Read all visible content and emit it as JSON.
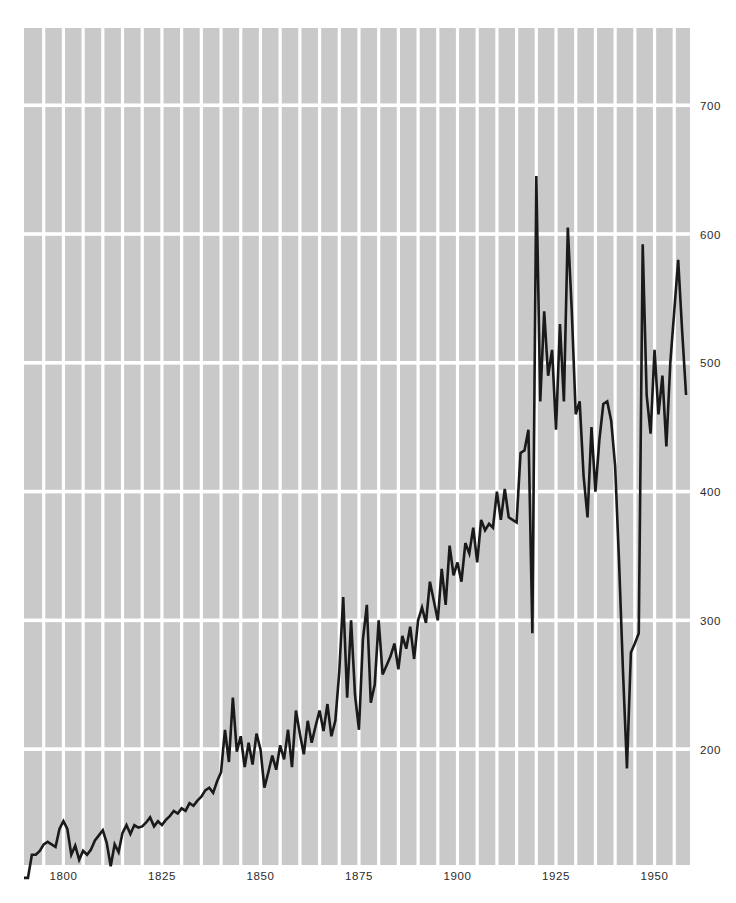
{
  "chart_data": {
    "type": "line",
    "title": "",
    "subtitle": "",
    "xlabel": "",
    "ylabel": "",
    "xlim": [
      1790,
      1959
    ],
    "ylim": [
      110,
      760
    ],
    "grid": true,
    "grid_x_step": 5,
    "legend": "none",
    "axis": {
      "y_ticks": [
        200,
        300,
        400,
        500,
        600,
        700
      ],
      "y_tick_labels": [
        "200",
        "300",
        "400",
        "500",
        "600",
        "700"
      ],
      "x_ticks": [
        1800,
        1825,
        1850,
        1875,
        1900,
        1925,
        1950
      ],
      "x_tick_labels": [
        "1800",
        "1825",
        "1850",
        "1875",
        "1900",
        "1925",
        "1950"
      ]
    },
    "colors": {
      "plot_background": "#c9c9c9",
      "gridline": "#ffffff",
      "line": "#1a1a1a",
      "page_background": "#ffffff",
      "tick_text": "#2b2b2b"
    },
    "series": [
      {
        "name": "value",
        "x": [
          1790,
          1791,
          1792,
          1793,
          1794,
          1795,
          1796,
          1797,
          1798,
          1799,
          1800,
          1801,
          1802,
          1803,
          1804,
          1805,
          1806,
          1807,
          1808,
          1809,
          1810,
          1811,
          1812,
          1813,
          1814,
          1815,
          1816,
          1817,
          1818,
          1819,
          1820,
          1821,
          1822,
          1823,
          1824,
          1825,
          1826,
          1827,
          1828,
          1829,
          1830,
          1831,
          1832,
          1833,
          1834,
          1835,
          1836,
          1837,
          1838,
          1839,
          1840,
          1841,
          1842,
          1843,
          1844,
          1845,
          1846,
          1847,
          1848,
          1849,
          1850,
          1851,
          1852,
          1853,
          1854,
          1855,
          1856,
          1857,
          1858,
          1859,
          1860,
          1861,
          1862,
          1863,
          1864,
          1865,
          1866,
          1867,
          1868,
          1869,
          1870,
          1871,
          1872,
          1873,
          1874,
          1875,
          1876,
          1877,
          1878,
          1879,
          1880,
          1881,
          1882,
          1883,
          1884,
          1885,
          1886,
          1887,
          1888,
          1889,
          1890,
          1891,
          1892,
          1893,
          1894,
          1895,
          1896,
          1897,
          1898,
          1899,
          1900,
          1901,
          1902,
          1903,
          1904,
          1905,
          1906,
          1907,
          1908,
          1909,
          1910,
          1911,
          1912,
          1913,
          1914,
          1915,
          1916,
          1917,
          1918,
          1919,
          1920,
          1921,
          1922,
          1923,
          1924,
          1925,
          1926,
          1927,
          1928,
          1929,
          1930,
          1931,
          1932,
          1933,
          1934,
          1935,
          1936,
          1937,
          1938,
          1939,
          1940,
          1941,
          1942,
          1943,
          1944,
          1945,
          1946,
          1947,
          1948,
          1949,
          1950,
          1951,
          1952,
          1953,
          1954,
          1955,
          1956,
          1957,
          1958
        ],
        "values": [
          100,
          100,
          118,
          118,
          121,
          126,
          128,
          126,
          124,
          138,
          144,
          138,
          118,
          125,
          114,
          121,
          118,
          122,
          129,
          133,
          137,
          127,
          109,
          126,
          120,
          135,
          141,
          134,
          141,
          139,
          140,
          143,
          147,
          140,
          144,
          141,
          145,
          148,
          152,
          150,
          154,
          152,
          158,
          156,
          160,
          163,
          168,
          170,
          166,
          175,
          182,
          215,
          190,
          240,
          198,
          210,
          186,
          205,
          188,
          212,
          200,
          170,
          182,
          195,
          184,
          203,
          192,
          215,
          186,
          230,
          212,
          196,
          222,
          205,
          218,
          230,
          214,
          235,
          210,
          222,
          260,
          318,
          240,
          300,
          242,
          215,
          285,
          312,
          236,
          250,
          300,
          258,
          265,
          272,
          282,
          262,
          288,
          278,
          295,
          270,
          300,
          310,
          298,
          330,
          315,
          300,
          340,
          312,
          358,
          335,
          345,
          330,
          360,
          352,
          372,
          345,
          378,
          370,
          375,
          372,
          400,
          378,
          402,
          380,
          378,
          376,
          430,
          432,
          448,
          290,
          645,
          470,
          540,
          490,
          510,
          448,
          530,
          470,
          605,
          540,
          460,
          470,
          412,
          380,
          450,
          400,
          440,
          468,
          470,
          455,
          420,
          345,
          260,
          185,
          275,
          282,
          290,
          592,
          475,
          445,
          510,
          460,
          490,
          435,
          500,
          540,
          580,
          525,
          475
        ],
        "style": "solid",
        "line_width": 2.6,
        "color": "#1a1a1a"
      }
    ]
  },
  "plot_geometry": {
    "left": 24,
    "top": 28,
    "right": 690,
    "bottom": 865,
    "y_tick_label_x": 700,
    "x_tick_label_y": 880
  }
}
